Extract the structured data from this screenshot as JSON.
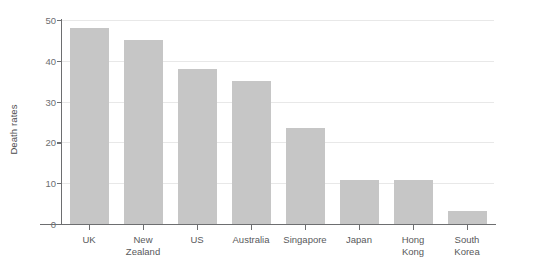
{
  "chart_data": {
    "type": "bar",
    "title": "",
    "subtitle": "",
    "xlabel": "",
    "ylabel": "Death rates",
    "categories": [
      "UK",
      "New Zealand",
      "US",
      "Australia",
      "Singapore",
      "Japan",
      "Hong Kong",
      "South Korea"
    ],
    "category_lines": [
      [
        "UK"
      ],
      [
        "New",
        "Zealand"
      ],
      [
        "US"
      ],
      [
        "Australia"
      ],
      [
        "Singapore"
      ],
      [
        "Japan"
      ],
      [
        "Hong",
        "Kong"
      ],
      [
        "South",
        "Korea"
      ]
    ],
    "values": [
      48,
      45,
      38,
      35,
      23.5,
      10.8,
      10.8,
      3.2
    ],
    "ylim": [
      0,
      50
    ],
    "yticks": [
      0,
      10,
      20,
      30,
      40,
      50
    ],
    "ytick_labels": [
      "0",
      "10",
      "20",
      "30",
      "40",
      "50"
    ],
    "grid": true,
    "grid_axis": "y",
    "legend": false,
    "legend_position": "none",
    "bar_color": "#c6c6c6",
    "gridline_color": "#e8e8e8",
    "axis_color": "#6d6e70",
    "text_color": "#58595b",
    "background_color": "#ffffff"
  }
}
